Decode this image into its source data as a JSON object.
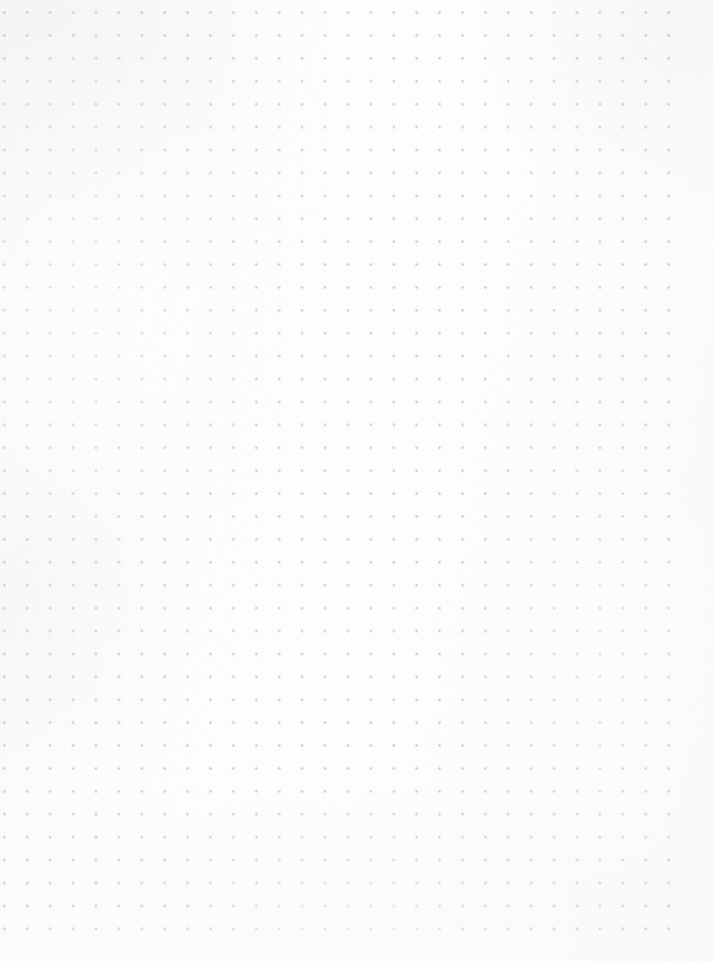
{
  "document": {
    "kind": "dot-grid-paper",
    "title": "Blank dot grid notebook page",
    "description": "Scanned blank bullet-journal style dot grid paper with no written content",
    "width_px": 713,
    "height_px": 961,
    "text_content": "",
    "visible_text_items": []
  },
  "paper": {
    "background_color": "#fdfdfd",
    "background_color_light": "#ffffff",
    "background_color_shadow": "#fafafb",
    "texture": "smooth-scanned-paper"
  },
  "grid": {
    "type": "dot",
    "dot_color": "#9a9aa6",
    "dot_color_soft": "#c8c8d0",
    "dot_diameter_px": 1.8,
    "spacing_x_px": 22.92,
    "spacing_y_px": 22.92,
    "origin_x_px": 15.8,
    "origin_y_px": 24.0,
    "columns": 30,
    "rows": 41,
    "left_margin_px": 16,
    "right_margin_px": 27,
    "top_margin_px": 24,
    "bottom_margin_px": 24,
    "opacity": 0.62
  },
  "grid_edges": {
    "top_partial_row": {
      "present": true,
      "y_px": 2,
      "extent_x_px": 270,
      "note": "clipped row at the scan edge, fades out toward the right"
    },
    "bottom_partial_row": {
      "present": true,
      "y_px": 958,
      "extent_x_px": 713,
      "note": "very faint clipped row at the bottom scan edge"
    }
  },
  "chart_data": null
}
